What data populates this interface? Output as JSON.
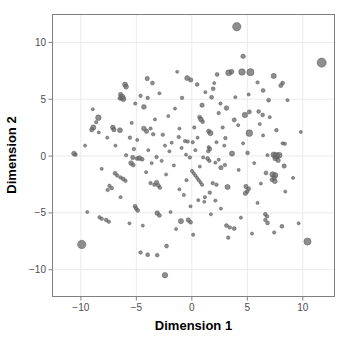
{
  "chart_data": {
    "type": "scatter",
    "title": "",
    "xlabel": "Dimension 1",
    "ylabel": "Dimension 2",
    "xlim": [
      -12.6,
      12.9
    ],
    "ylim": [
      -12.4,
      12.5
    ],
    "xticks": [
      -10,
      -5,
      0,
      5,
      10
    ],
    "xticklabels": [
      "-10",
      "-5",
      "0",
      "5",
      "10"
    ],
    "yticks": [
      10,
      5,
      0,
      -5,
      -10
    ],
    "yticklabels": [
      "10",
      "5",
      "0",
      "-5",
      "-10"
    ],
    "grid": true,
    "legend": "none",
    "point_color": "#6e6e6e",
    "point_edge_color": "#4a4a4a",
    "panel_background": "#ffffff",
    "gridline_color": "#ebebeb",
    "panel_border_color": "#808080",
    "size_encoding": "point area varies by magnitude",
    "n_points": 232,
    "points": [
      {
        "x": 4.05,
        "y": 11.38,
        "s": 4.2
      },
      {
        "x": 11.7,
        "y": 8.22,
        "s": 4.6
      },
      {
        "x": 4.62,
        "y": 8.78,
        "s": 2.3
      },
      {
        "x": 3.32,
        "y": 7.32,
        "s": 3.0
      },
      {
        "x": 3.58,
        "y": 7.42,
        "s": 2.4
      },
      {
        "x": 4.52,
        "y": 7.4,
        "s": 3.3
      },
      {
        "x": 5.28,
        "y": 7.38,
        "s": 3.6
      },
      {
        "x": 2.28,
        "y": 7.18,
        "s": 2.0
      },
      {
        "x": 7.38,
        "y": 7.05,
        "s": 2.6
      },
      {
        "x": -4.02,
        "y": 6.82,
        "s": 2.2
      },
      {
        "x": -0.42,
        "y": 6.86,
        "s": 2.5
      },
      {
        "x": -0.1,
        "y": 6.7,
        "s": 2.2
      },
      {
        "x": -3.55,
        "y": 6.42,
        "s": 2.0
      },
      {
        "x": -6.02,
        "y": 6.3,
        "s": 2.5
      },
      {
        "x": -5.92,
        "y": 6.1,
        "s": 2.4
      },
      {
        "x": 8.18,
        "y": 6.42,
        "s": 2.0
      },
      {
        "x": 8.02,
        "y": 6.2,
        "s": 2.1
      },
      {
        "x": 0.48,
        "y": 6.3,
        "s": 1.9
      },
      {
        "x": 1.92,
        "y": 5.92,
        "s": 2.0
      },
      {
        "x": 6.42,
        "y": 5.78,
        "s": 2.0
      },
      {
        "x": -6.42,
        "y": 5.42,
        "s": 2.2
      },
      {
        "x": -6.28,
        "y": 5.18,
        "s": 3.0
      },
      {
        "x": -6.18,
        "y": 5.02,
        "s": 2.6
      },
      {
        "x": -6.48,
        "y": 5.08,
        "s": 2.0
      },
      {
        "x": -4.62,
        "y": 5.3,
        "s": 1.8
      },
      {
        "x": -3.98,
        "y": 5.12,
        "s": 1.8
      },
      {
        "x": -0.88,
        "y": 5.12,
        "s": 1.8
      },
      {
        "x": 1.78,
        "y": 5.18,
        "s": 2.0
      },
      {
        "x": 6.92,
        "y": 4.92,
        "s": 2.0
      },
      {
        "x": -5.1,
        "y": 4.62,
        "s": 1.7
      },
      {
        "x": -4.32,
        "y": 4.32,
        "s": 2.4
      },
      {
        "x": 3.12,
        "y": 4.22,
        "s": 2.3
      },
      {
        "x": 0.92,
        "y": 4.48,
        "s": 2.2
      },
      {
        "x": 5.18,
        "y": 3.88,
        "s": 2.1
      },
      {
        "x": 6.02,
        "y": 3.92,
        "s": 1.9
      },
      {
        "x": 4.78,
        "y": 3.62,
        "s": 2.7
      },
      {
        "x": 6.38,
        "y": 3.62,
        "s": 1.9
      },
      {
        "x": -8.42,
        "y": 3.38,
        "s": 2.8
      },
      {
        "x": -8.62,
        "y": 2.98,
        "s": 1.7
      },
      {
        "x": 0.7,
        "y": 3.42,
        "s": 2.0
      },
      {
        "x": 0.82,
        "y": 3.22,
        "s": 2.4
      },
      {
        "x": 3.82,
        "y": 3.18,
        "s": 2.1
      },
      {
        "x": 0.98,
        "y": 3.02,
        "s": 1.9
      },
      {
        "x": -8.88,
        "y": 2.52,
        "s": 2.6
      },
      {
        "x": -9.02,
        "y": 2.32,
        "s": 2.2
      },
      {
        "x": -8.38,
        "y": 2.08,
        "s": 1.6
      },
      {
        "x": -7.12,
        "y": 2.52,
        "s": 2.4
      },
      {
        "x": -7.02,
        "y": 2.32,
        "s": 2.2
      },
      {
        "x": -6.48,
        "y": 2.28,
        "s": 2.5
      },
      {
        "x": -4.32,
        "y": 2.42,
        "s": 2.4
      },
      {
        "x": -4.08,
        "y": 2.18,
        "s": 2.2
      },
      {
        "x": -3.72,
        "y": 2.42,
        "s": 1.7
      },
      {
        "x": -3.48,
        "y": 1.92,
        "s": 1.8
      },
      {
        "x": -2.62,
        "y": 1.88,
        "s": 1.8
      },
      {
        "x": 1.52,
        "y": 2.18,
        "s": 2.2
      },
      {
        "x": 1.68,
        "y": 2.02,
        "s": 2.6
      },
      {
        "x": 5.18,
        "y": 2.02,
        "s": 3.4
      },
      {
        "x": 7.62,
        "y": 2.28,
        "s": 1.8
      },
      {
        "x": -5.58,
        "y": 1.62,
        "s": 1.8
      },
      {
        "x": -1.18,
        "y": 1.68,
        "s": 1.8
      },
      {
        "x": 3.02,
        "y": 1.58,
        "s": 1.8
      },
      {
        "x": -0.62,
        "y": 1.32,
        "s": 1.7
      },
      {
        "x": -0.38,
        "y": 1.28,
        "s": 1.8
      },
      {
        "x": 0.08,
        "y": 1.22,
        "s": 1.7
      },
      {
        "x": 2.22,
        "y": 1.22,
        "s": 1.6
      },
      {
        "x": 8.18,
        "y": 1.12,
        "s": 1.7
      },
      {
        "x": 8.38,
        "y": 1.08,
        "s": 1.7
      },
      {
        "x": -10.62,
        "y": 0.22,
        "s": 2.4
      },
      {
        "x": -10.48,
        "y": 0.12,
        "s": 1.8
      },
      {
        "x": -5.22,
        "y": 0.62,
        "s": 1.8
      },
      {
        "x": 1.52,
        "y": 0.78,
        "s": 1.7
      },
      {
        "x": 1.62,
        "y": 0.62,
        "s": 2.1
      },
      {
        "x": 1.48,
        "y": 0.42,
        "s": 1.8
      },
      {
        "x": 3.62,
        "y": 0.22,
        "s": 2.6
      },
      {
        "x": 5.02,
        "y": 0.28,
        "s": 1.9
      },
      {
        "x": 6.82,
        "y": 0.08,
        "s": 1.6
      },
      {
        "x": 7.38,
        "y": 0.12,
        "s": 2.8
      },
      {
        "x": 7.62,
        "y": 0.02,
        "s": 3.4
      },
      {
        "x": 7.88,
        "y": 0.08,
        "s": 2.8
      },
      {
        "x": 7.52,
        "y": -0.22,
        "s": 2.4
      },
      {
        "x": 7.78,
        "y": -0.38,
        "s": 2.2
      },
      {
        "x": -5.32,
        "y": -0.12,
        "s": 2.2
      },
      {
        "x": -4.92,
        "y": -0.22,
        "s": 2.0
      },
      {
        "x": -4.72,
        "y": -0.18,
        "s": 2.4
      },
      {
        "x": -4.48,
        "y": -0.28,
        "s": 2.0
      },
      {
        "x": -3.18,
        "y": -0.08,
        "s": 1.8
      },
      {
        "x": -0.18,
        "y": -0.12,
        "s": 1.8
      },
      {
        "x": 1.42,
        "y": -0.22,
        "s": 2.0
      },
      {
        "x": 1.58,
        "y": -0.42,
        "s": 1.8
      },
      {
        "x": -5.48,
        "y": -0.62,
        "s": 2.4
      },
      {
        "x": -5.28,
        "y": -0.78,
        "s": 2.0
      },
      {
        "x": -3.62,
        "y": -0.62,
        "s": 1.6
      },
      {
        "x": 2.12,
        "y": -0.58,
        "s": 1.6
      },
      {
        "x": 2.98,
        "y": -0.78,
        "s": 1.8
      },
      {
        "x": 8.32,
        "y": -0.88,
        "s": 2.2
      },
      {
        "x": 2.62,
        "y": -1.02,
        "s": 2.2
      },
      {
        "x": 6.68,
        "y": -1.48,
        "s": 2.0
      },
      {
        "x": 7.28,
        "y": -1.62,
        "s": 2.8
      },
      {
        "x": 7.52,
        "y": -1.68,
        "s": 2.6
      },
      {
        "x": 7.42,
        "y": -1.92,
        "s": 2.2
      },
      {
        "x": 7.22,
        "y": -2.08,
        "s": 2.0
      },
      {
        "x": 7.48,
        "y": -2.22,
        "s": 2.4
      },
      {
        "x": -6.92,
        "y": -1.52,
        "s": 2.0
      },
      {
        "x": -6.72,
        "y": -1.72,
        "s": 1.8
      },
      {
        "x": -6.42,
        "y": -1.88,
        "s": 1.8
      },
      {
        "x": -6.18,
        "y": -2.02,
        "s": 2.0
      },
      {
        "x": -5.98,
        "y": -2.18,
        "s": 1.8
      },
      {
        "x": -7.42,
        "y": -2.62,
        "s": 1.8
      },
      {
        "x": -7.22,
        "y": -2.82,
        "s": 1.9
      },
      {
        "x": -7.58,
        "y": -2.98,
        "s": 1.8
      },
      {
        "x": -3.72,
        "y": -2.38,
        "s": 1.8
      },
      {
        "x": -3.38,
        "y": -2.52,
        "s": 1.8
      },
      {
        "x": -3.18,
        "y": -2.32,
        "s": 2.2
      },
      {
        "x": -3.02,
        "y": -2.58,
        "s": 2.0
      },
      {
        "x": -2.88,
        "y": -2.78,
        "s": 1.8
      },
      {
        "x": -0.48,
        "y": -2.12,
        "s": 1.7
      },
      {
        "x": 0.02,
        "y": -1.32,
        "s": 1.7
      },
      {
        "x": 0.18,
        "y": -1.52,
        "s": 1.6
      },
      {
        "x": 0.32,
        "y": -1.72,
        "s": 1.7
      },
      {
        "x": 0.48,
        "y": -1.92,
        "s": 1.6
      },
      {
        "x": 0.62,
        "y": -2.12,
        "s": 1.7
      },
      {
        "x": 0.78,
        "y": -2.32,
        "s": 1.6
      },
      {
        "x": 0.92,
        "y": -2.52,
        "s": 1.7
      },
      {
        "x": 1.88,
        "y": -2.38,
        "s": 1.8
      },
      {
        "x": 2.22,
        "y": -2.52,
        "s": 1.8
      },
      {
        "x": 3.22,
        "y": -2.72,
        "s": 2.6
      },
      {
        "x": 4.88,
        "y": -2.68,
        "s": 2.2
      },
      {
        "x": 5.12,
        "y": -2.88,
        "s": 2.0
      },
      {
        "x": 4.98,
        "y": -3.12,
        "s": 2.0
      },
      {
        "x": 4.82,
        "y": -3.28,
        "s": 2.2
      },
      {
        "x": 1.62,
        "y": -3.22,
        "s": 1.8
      },
      {
        "x": 1.18,
        "y": -3.62,
        "s": 1.7
      },
      {
        "x": 0.58,
        "y": -3.88,
        "s": 1.6
      },
      {
        "x": 1.12,
        "y": -4.02,
        "s": 1.6
      },
      {
        "x": 2.12,
        "y": -3.92,
        "s": 1.7
      },
      {
        "x": -5.12,
        "y": -4.42,
        "s": 2.0
      },
      {
        "x": -5.02,
        "y": -4.62,
        "s": 1.9
      },
      {
        "x": -4.88,
        "y": -4.78,
        "s": 2.0
      },
      {
        "x": -3.12,
        "y": -5.02,
        "s": 2.4
      },
      {
        "x": -2.92,
        "y": -5.22,
        "s": 2.0
      },
      {
        "x": -0.98,
        "y": -5.72,
        "s": 2.6
      },
      {
        "x": -0.32,
        "y": -5.62,
        "s": 2.2
      },
      {
        "x": -0.12,
        "y": -5.82,
        "s": 2.0
      },
      {
        "x": -7.72,
        "y": -5.62,
        "s": 1.9
      },
      {
        "x": -7.48,
        "y": -5.78,
        "s": 1.8
      },
      {
        "x": -8.12,
        "y": -5.52,
        "s": 1.8
      },
      {
        "x": -8.32,
        "y": -5.38,
        "s": 1.7
      },
      {
        "x": 6.62,
        "y": -5.12,
        "s": 1.9
      },
      {
        "x": 6.78,
        "y": -5.32,
        "s": 1.8
      },
      {
        "x": 6.62,
        "y": -5.62,
        "s": 1.8
      },
      {
        "x": 6.82,
        "y": -5.88,
        "s": 2.0
      },
      {
        "x": 8.12,
        "y": -6.18,
        "s": 2.0
      },
      {
        "x": 7.42,
        "y": -6.72,
        "s": 1.7
      },
      {
        "x": 3.12,
        "y": -6.12,
        "s": 2.0
      },
      {
        "x": 3.42,
        "y": -6.28,
        "s": 1.8
      },
      {
        "x": 3.82,
        "y": -6.38,
        "s": 2.0
      },
      {
        "x": 3.28,
        "y": -7.18,
        "s": 1.8
      },
      {
        "x": 0.12,
        "y": -6.92,
        "s": 1.7
      },
      {
        "x": -9.92,
        "y": -7.78,
        "s": 4.2
      },
      {
        "x": 10.42,
        "y": -7.52,
        "s": 3.6
      },
      {
        "x": -2.28,
        "y": -7.92,
        "s": 2.0
      },
      {
        "x": -4.62,
        "y": -8.48,
        "s": 1.8
      },
      {
        "x": -3.98,
        "y": -8.68,
        "s": 2.0
      },
      {
        "x": -3.12,
        "y": -8.72,
        "s": 1.9
      },
      {
        "x": -2.42,
        "y": -10.48,
        "s": 2.8
      },
      {
        "x": -5.92,
        "y": 0.08,
        "s": 1.7
      },
      {
        "x": -2.02,
        "y": 0.42,
        "s": 1.6
      },
      {
        "x": -1.82,
        "y": 1.18,
        "s": 1.6
      },
      {
        "x": -0.92,
        "y": 0.72,
        "s": 1.6
      },
      {
        "x": 0.52,
        "y": 1.62,
        "s": 1.6
      },
      {
        "x": 2.42,
        "y": 3.78,
        "s": 1.8
      },
      {
        "x": 2.58,
        "y": 4.62,
        "s": 1.7
      },
      {
        "x": 5.92,
        "y": 6.48,
        "s": 1.7
      },
      {
        "x": 5.12,
        "y": 5.42,
        "s": 1.6
      },
      {
        "x": -1.52,
        "y": 4.18,
        "s": 1.6
      },
      {
        "x": -2.12,
        "y": 3.52,
        "s": 1.6
      },
      {
        "x": -3.32,
        "y": 3.22,
        "s": 1.6
      },
      {
        "x": -1.12,
        "y": 2.42,
        "s": 1.6
      },
      {
        "x": 0.22,
        "y": 2.52,
        "s": 1.7
      },
      {
        "x": 2.78,
        "y": 2.52,
        "s": 1.7
      },
      {
        "x": 4.18,
        "y": 2.72,
        "s": 1.6
      },
      {
        "x": 6.42,
        "y": 1.82,
        "s": 1.6
      },
      {
        "x": -4.92,
        "y": 1.42,
        "s": 1.6
      },
      {
        "x": -6.88,
        "y": 0.92,
        "s": 1.6
      },
      {
        "x": -2.72,
        "y": -0.42,
        "s": 1.6
      },
      {
        "x": -1.62,
        "y": -0.82,
        "s": 1.6
      },
      {
        "x": 0.72,
        "y": -0.92,
        "s": 1.6
      },
      {
        "x": 4.22,
        "y": -1.22,
        "s": 1.6
      },
      {
        "x": 5.62,
        "y": -0.62,
        "s": 1.6
      },
      {
        "x": -8.12,
        "y": -1.12,
        "s": 1.6
      },
      {
        "x": -4.12,
        "y": -1.42,
        "s": 1.6
      },
      {
        "x": -2.32,
        "y": -1.62,
        "s": 1.6
      },
      {
        "x": -1.12,
        "y": -2.92,
        "s": 1.6
      },
      {
        "x": -0.72,
        "y": -3.42,
        "s": 1.6
      },
      {
        "x": 2.62,
        "y": -4.62,
        "s": 1.6
      },
      {
        "x": -1.92,
        "y": -4.92,
        "s": 1.6
      },
      {
        "x": -6.42,
        "y": -3.62,
        "s": 1.6
      },
      {
        "x": 5.92,
        "y": -4.12,
        "s": 1.6
      },
      {
        "x": 8.42,
        "y": -3.12,
        "s": 1.6
      },
      {
        "x": 9.12,
        "y": -1.92,
        "s": 1.6
      },
      {
        "x": 2.92,
        "y": 0.92,
        "s": 1.6
      },
      {
        "x": 4.62,
        "y": 1.12,
        "s": 1.6
      },
      {
        "x": -0.52,
        "y": 0.12,
        "s": 1.6
      },
      {
        "x": 0.32,
        "y": 0.52,
        "s": 1.6
      },
      {
        "x": 1.02,
        "y": -0.12,
        "s": 1.6
      },
      {
        "x": 2.42,
        "y": -0.32,
        "s": 1.6
      },
      {
        "x": -2.42,
        "y": 0.92,
        "s": 1.6
      },
      {
        "x": -3.92,
        "y": 0.52,
        "s": 1.6
      },
      {
        "x": 6.12,
        "y": 2.82,
        "s": 1.6
      },
      {
        "x": 7.02,
        "y": 3.42,
        "s": 1.6
      },
      {
        "x": 1.22,
        "y": 5.62,
        "s": 1.6
      },
      {
        "x": -2.92,
        "y": 5.52,
        "s": 1.6
      },
      {
        "x": -5.42,
        "y": 2.92,
        "s": 1.6
      },
      {
        "x": -7.62,
        "y": 1.62,
        "s": 1.6
      },
      {
        "x": 3.92,
        "y": 5.18,
        "s": 1.6
      },
      {
        "x": 2.02,
        "y": 6.42,
        "s": 1.6
      },
      {
        "x": 8.62,
        "y": 4.92,
        "s": 1.6
      },
      {
        "x": -0.12,
        "y": -4.42,
        "s": 1.6
      },
      {
        "x": 1.72,
        "y": -5.12,
        "s": 1.6
      },
      {
        "x": -4.42,
        "y": -6.12,
        "s": 1.6
      },
      {
        "x": -5.62,
        "y": -5.92,
        "s": 1.6
      },
      {
        "x": 4.42,
        "y": -5.42,
        "s": 1.6
      },
      {
        "x": -1.42,
        "y": -6.42,
        "s": 1.6
      },
      {
        "x": 5.42,
        "y": -6.82,
        "s": 1.6
      },
      {
        "x": 9.62,
        "y": -5.92,
        "s": 1.6
      },
      {
        "x": -9.42,
        "y": -4.92,
        "s": 1.6
      },
      {
        "x": -8.92,
        "y": 4.12,
        "s": 1.6
      },
      {
        "x": 9.82,
        "y": 2.12,
        "s": 1.6
      },
      {
        "x": -1.32,
        "y": 7.42,
        "s": 1.6
      },
      {
        "x": 6.22,
        "y": -2.42,
        "s": 1.6
      },
      {
        "x": -9.62,
        "y": 0.92,
        "s": 1.6
      }
    ]
  }
}
